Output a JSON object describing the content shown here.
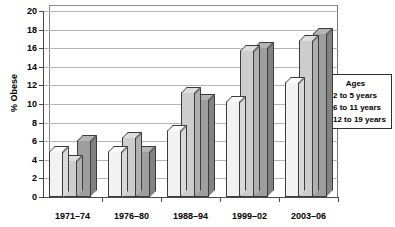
{
  "chart_data": {
    "type": "bar",
    "title": "",
    "xlabel": "",
    "ylabel": "% Obese",
    "ylim": [
      0,
      20
    ],
    "ytick_step": 2,
    "yticks": [
      0,
      2,
      4,
      6,
      8,
      10,
      12,
      14,
      16,
      18,
      20
    ],
    "ytick_labels": [
      "0",
      "2",
      "4",
      "6",
      "8",
      "10",
      "12",
      "14",
      "16",
      "18",
      "20"
    ],
    "grid": true,
    "grid_axis": "y",
    "legend_position": "right",
    "legend_title": "Ages",
    "categories": [
      "1971–74",
      "1976–80",
      "1988–94",
      "1999–02",
      "2003–06"
    ],
    "series": [
      {
        "name": "2 to 5 years",
        "color": "#f2f2f2",
        "side_color": "#d9d9d9",
        "top_color": "#fbfbfb",
        "values": [
          5.0,
          5.0,
          7.2,
          10.3,
          12.4
        ]
      },
      {
        "name": "6 to 11 years",
        "color": "#cdcdcd",
        "side_color": "#b0b0b0",
        "top_color": "#dedede",
        "values": [
          4.0,
          6.5,
          11.3,
          15.8,
          16.9
        ]
      },
      {
        "name": "12 to 19 years",
        "color": "#9e9e9e",
        "side_color": "#828282",
        "top_color": "#b4b4b4",
        "values": [
          6.1,
          5.0,
          10.5,
          16.1,
          17.6
        ]
      }
    ]
  },
  "legend": {
    "title": "Ages",
    "items": [
      {
        "label": "2 to 5 years"
      },
      {
        "label": "6 to 11 years"
      },
      {
        "label": "12 to 19 years"
      }
    ]
  },
  "axes": {
    "y_label": "% Obese"
  }
}
